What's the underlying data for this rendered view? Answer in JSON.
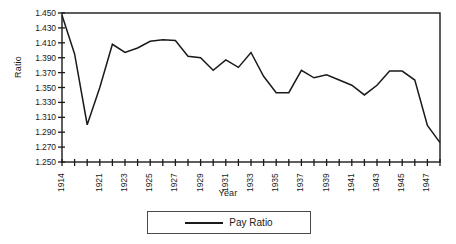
{
  "chart_data": {
    "type": "line",
    "title": "",
    "xlabel": "Year",
    "ylabel": "Ratio",
    "ylim": [
      1.25,
      1.45
    ],
    "ytick_labels": [
      "1.450",
      "1.430",
      "1.410",
      "1.390",
      "1.370",
      "1.350",
      "1.330",
      "1.310",
      "1.290",
      "1.270",
      "1.250"
    ],
    "ytick_values": [
      1.45,
      1.43,
      1.41,
      1.39,
      1.37,
      1.35,
      1.33,
      1.31,
      1.29,
      1.27,
      1.25
    ],
    "xtick_labels": [
      "1914",
      "1921",
      "1923",
      "1925",
      "1927",
      "1929",
      "1931",
      "1933",
      "1935",
      "1937",
      "1939",
      "1941",
      "1943",
      "1945",
      "1947"
    ],
    "grid": false,
    "legend_position": "bottom",
    "series": [
      {
        "name": "Pay Ratio",
        "color": "#1a1a1a",
        "x": [
          1914,
          1919,
          1920,
          1921,
          1922,
          1923,
          1924,
          1925,
          1926,
          1927,
          1928,
          1929,
          1930,
          1931,
          1932,
          1933,
          1934,
          1935,
          1936,
          1937,
          1938,
          1939,
          1940,
          1941,
          1942,
          1943,
          1944,
          1945,
          1946,
          1947,
          1948
        ],
        "values": [
          1.447,
          1.395,
          1.3,
          1.35,
          1.408,
          1.397,
          1.403,
          1.412,
          1.414,
          1.413,
          1.392,
          1.39,
          1.373,
          1.387,
          1.377,
          1.397,
          1.365,
          1.343,
          1.343,
          1.373,
          1.363,
          1.367,
          1.36,
          1.353,
          1.34,
          1.353,
          1.372,
          1.372,
          1.36,
          1.299,
          1.276
        ]
      }
    ]
  },
  "legend": {
    "entries": [
      {
        "label": "Pay Ratio"
      }
    ]
  }
}
